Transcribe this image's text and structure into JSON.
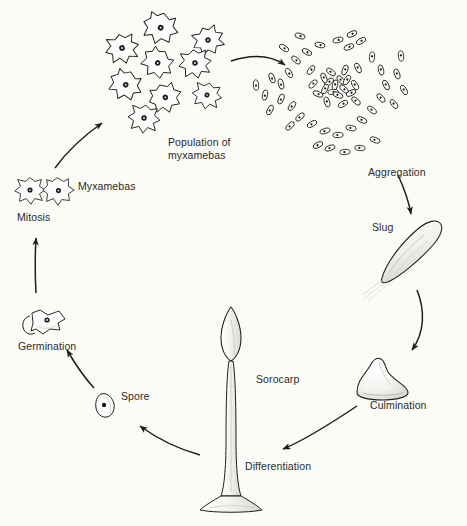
{
  "diagram": {
    "organism": "Dictyostelium (cellular slime mold)",
    "background_color": "#fbfbf8",
    "ink_color": "#1d1d1b",
    "style": "black and white scientific line drawing"
  },
  "stages": [
    {
      "id": "population",
      "label": "Population of\nmyxamebas",
      "label_x": 168,
      "label_y": 136,
      "illustration": "cluster of nine irregular amoeboid cells each with a dark nucleus"
    },
    {
      "id": "aggregation",
      "label": "Aggregation",
      "label_x": 368,
      "label_y": 166,
      "illustration": "radial swarm of elongated cells streaming into a dense center"
    },
    {
      "id": "slug",
      "label": "Slug",
      "label_x": 372,
      "label_y": 221,
      "illustration": "elongated diagonal migrating pseudoplasmodium with slime trail"
    },
    {
      "id": "culmination",
      "label": "Culmination",
      "label_x": 370,
      "label_y": 399,
      "illustration": "dome shaped mound with a raised apical tip"
    },
    {
      "id": "differentiation",
      "label": "Differentiation",
      "label_x": 245,
      "label_y": 460,
      "illustration": "arrow pointing toward the developing fruiting body"
    },
    {
      "id": "sorocarp",
      "label": "Sorocarp",
      "label_x": 256,
      "label_y": 373,
      "illustration": "tall fruiting body with bulbous spore head, slender stalk and flared basal disc"
    },
    {
      "id": "spore",
      "label": "Spore",
      "label_x": 121,
      "label_y": 390,
      "illustration": "single oval spore with dark nucleus"
    },
    {
      "id": "germination",
      "label": "Germination",
      "label_x": 18,
      "label_y": 340,
      "illustration": "amoeba emerging from a split spore case"
    },
    {
      "id": "mitosis",
      "label": "Mitosis",
      "label_x": 17,
      "label_y": 211,
      "illustration": "two joined amoebae dividing"
    },
    {
      "id": "myxamebas",
      "label": "Myxamebas",
      "label_x": 78,
      "label_y": 180,
      "illustration": "pair of amoeboid cells with nuclei"
    }
  ],
  "cycle_direction": "clockwise",
  "arrows": [
    {
      "id": "mitosis-to-population",
      "from": "mitosis",
      "to": "population"
    },
    {
      "id": "population-to-aggregation",
      "from": "population",
      "to": "aggregation"
    },
    {
      "id": "aggregation-to-slug",
      "from": "aggregation",
      "to": "slug"
    },
    {
      "id": "slug-to-culmination",
      "from": "slug",
      "to": "culmination"
    },
    {
      "id": "culmination-to-differentiation",
      "from": "culmination",
      "to": "differentiation"
    },
    {
      "id": "sorocarp-to-spore",
      "from": "sorocarp",
      "to": "spore"
    },
    {
      "id": "spore-to-germination",
      "from": "spore",
      "to": "germination"
    },
    {
      "id": "germination-to-mitosis",
      "from": "germination",
      "to": "mitosis"
    }
  ]
}
